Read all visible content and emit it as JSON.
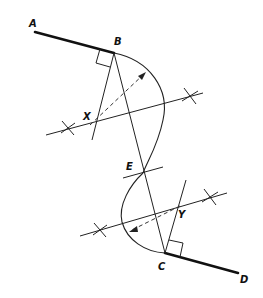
{
  "diagram": {
    "title": "",
    "labels": {
      "A": "A",
      "B": "B",
      "C": "C",
      "D": "D",
      "E": "E",
      "X": "X",
      "Y": "Y"
    },
    "points": {
      "A": [
        35,
        32
      ],
      "B": [
        114,
        53
      ],
      "E": [
        143,
        173
      ],
      "C": [
        165,
        253
      ],
      "D": [
        238,
        273
      ],
      "X": [
        88,
        125
      ],
      "Y": [
        182,
        204
      ]
    },
    "elements": [
      {
        "type": "tangent-line",
        "from": "A",
        "to": "B",
        "style": "thick"
      },
      {
        "type": "tangent-line",
        "from": "C",
        "to": "D",
        "style": "thick"
      },
      {
        "type": "chord",
        "from": "B",
        "to": "C"
      },
      {
        "type": "perpendicular-bisector",
        "of": "BE",
        "ticks": 2
      },
      {
        "type": "perpendicular-bisector",
        "of": "EC",
        "ticks": 2
      },
      {
        "type": "perpendicular",
        "at": "B",
        "right_angle_mark": true
      },
      {
        "type": "perpendicular",
        "at": "C",
        "right_angle_mark": true
      },
      {
        "type": "arc",
        "center": "X",
        "from": "B",
        "to": "E"
      },
      {
        "type": "arc",
        "center": "Y",
        "from": "E",
        "to": "C"
      },
      {
        "type": "radius-arrow",
        "from": "X",
        "dashed": true
      },
      {
        "type": "radius-arrow",
        "from": "Y",
        "dashed": true
      }
    ],
    "colors": {
      "stroke": "#222222",
      "background": "#ffffff"
    }
  }
}
